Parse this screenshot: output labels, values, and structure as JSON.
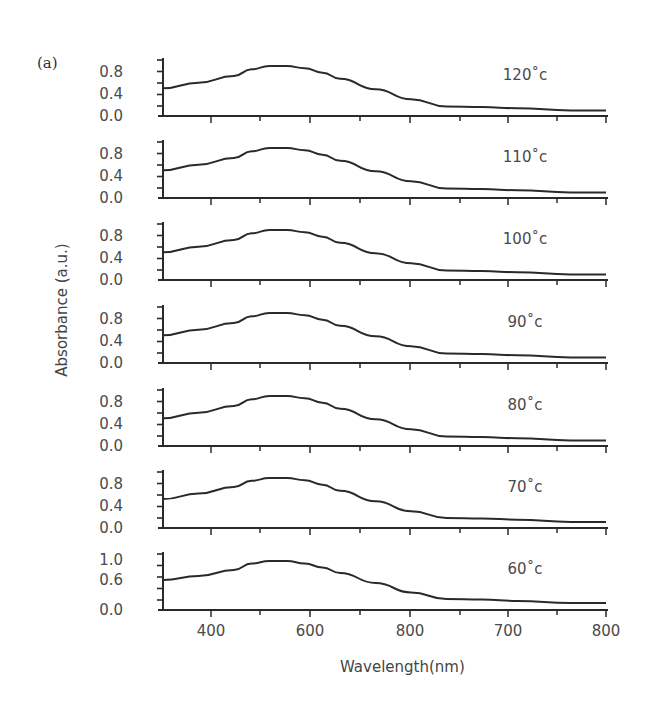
{
  "figure": {
    "panel_label": "(a)",
    "ylabel": "Absorbance (a.u.)",
    "xlabel": "Wavelength(nm)"
  },
  "chart_data": [
    {
      "type": "line",
      "title": "120°c",
      "label": "120˚c",
      "yticks": [
        "0.0",
        "0.4",
        "0.8"
      ],
      "ylim": [
        0,
        0.9
      ],
      "x": [
        300,
        340,
        380,
        400,
        420,
        440,
        460,
        480,
        500,
        540,
        580,
        620,
        660,
        700,
        760,
        800
      ],
      "y": [
        0.5,
        0.6,
        0.72,
        0.84,
        0.9,
        0.9,
        0.86,
        0.78,
        0.67,
        0.48,
        0.3,
        0.17,
        0.16,
        0.14,
        0.1,
        0.1
      ]
    },
    {
      "type": "line",
      "title": "110°c",
      "label": "110˚c",
      "yticks": [
        "0.0",
        "0.4",
        "0.8"
      ],
      "ylim": [
        0,
        0.9
      ],
      "x": [
        300,
        340,
        380,
        400,
        420,
        440,
        460,
        480,
        500,
        540,
        580,
        620,
        660,
        700,
        760,
        800
      ],
      "y": [
        0.5,
        0.6,
        0.72,
        0.84,
        0.9,
        0.9,
        0.86,
        0.78,
        0.67,
        0.48,
        0.3,
        0.17,
        0.16,
        0.14,
        0.1,
        0.1
      ]
    },
    {
      "type": "line",
      "title": "100°c",
      "label": "100˚c",
      "yticks": [
        "0.0",
        "0.4",
        "0.8"
      ],
      "ylim": [
        0,
        0.9
      ],
      "x": [
        300,
        340,
        380,
        400,
        420,
        440,
        460,
        480,
        500,
        540,
        580,
        620,
        660,
        700,
        760,
        800
      ],
      "y": [
        0.5,
        0.6,
        0.72,
        0.84,
        0.9,
        0.9,
        0.86,
        0.78,
        0.67,
        0.48,
        0.3,
        0.17,
        0.16,
        0.14,
        0.1,
        0.1
      ]
    },
    {
      "type": "line",
      "title": "90°c",
      "label": "90˚c",
      "yticks": [
        "0.0",
        "0.4",
        "0.8"
      ],
      "ylim": [
        0,
        0.9
      ],
      "x": [
        300,
        340,
        380,
        400,
        420,
        440,
        460,
        480,
        500,
        540,
        580,
        620,
        660,
        700,
        760,
        800
      ],
      "y": [
        0.5,
        0.6,
        0.72,
        0.84,
        0.9,
        0.9,
        0.86,
        0.78,
        0.67,
        0.48,
        0.3,
        0.17,
        0.16,
        0.14,
        0.1,
        0.1
      ]
    },
    {
      "type": "line",
      "title": "80°c",
      "label": "80˚c",
      "yticks": [
        "0.0",
        "0.4",
        "0.8"
      ],
      "ylim": [
        0,
        0.9
      ],
      "x": [
        300,
        340,
        380,
        400,
        420,
        440,
        460,
        480,
        500,
        540,
        580,
        620,
        660,
        700,
        760,
        800
      ],
      "y": [
        0.5,
        0.6,
        0.72,
        0.84,
        0.9,
        0.9,
        0.86,
        0.78,
        0.67,
        0.48,
        0.3,
        0.17,
        0.16,
        0.14,
        0.1,
        0.1
      ]
    },
    {
      "type": "line",
      "title": "70°c",
      "label": "70˚c",
      "yticks": [
        "0.0",
        "0.4",
        "0.8"
      ],
      "ylim": [
        0,
        0.9
      ],
      "x": [
        300,
        340,
        380,
        400,
        420,
        440,
        460,
        480,
        500,
        540,
        580,
        620,
        660,
        700,
        760,
        800
      ],
      "y": [
        0.52,
        0.62,
        0.74,
        0.85,
        0.9,
        0.9,
        0.86,
        0.78,
        0.67,
        0.48,
        0.3,
        0.18,
        0.17,
        0.15,
        0.11,
        0.11
      ]
    },
    {
      "type": "line",
      "title": "60°c",
      "label": "60˚c",
      "yticks": [
        "0.0",
        "0.6",
        "1.0"
      ],
      "ylim": [
        0,
        1.0
      ],
      "x": [
        300,
        340,
        380,
        400,
        420,
        440,
        460,
        480,
        500,
        540,
        580,
        620,
        660,
        700,
        760,
        800
      ],
      "y": [
        0.6,
        0.68,
        0.8,
        0.93,
        0.98,
        0.98,
        0.93,
        0.85,
        0.74,
        0.54,
        0.35,
        0.22,
        0.21,
        0.18,
        0.14,
        0.14
      ]
    }
  ],
  "x_axis": {
    "tick_labels": [
      "400",
      "600",
      "800",
      "700",
      "800"
    ],
    "range": [
      300,
      800
    ]
  }
}
